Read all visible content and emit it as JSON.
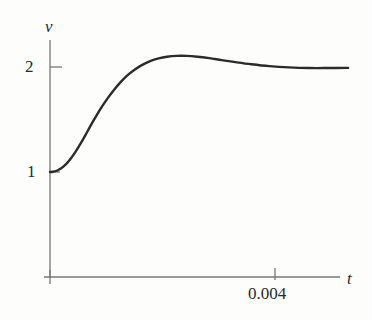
{
  "figure": {
    "name": "step-response-plot",
    "background_color": "#fdfdfc",
    "ink_color": "#2b2b2b",
    "axis_color": "#6e6e6e"
  },
  "axes": {
    "y_axis_label": "v",
    "x_axis_label": "t",
    "y_ticks": [
      {
        "label": "1",
        "value": 1
      },
      {
        "label": "2",
        "value": 2
      }
    ],
    "x_ticks": [
      {
        "label": "0.004",
        "value": 0.004
      }
    ]
  },
  "chart_data": {
    "type": "line",
    "title": "",
    "subtitle": "",
    "xlabel": "t",
    "ylabel": "v",
    "xlim": [
      0,
      0.0053
    ],
    "ylim": [
      0,
      2.62
    ],
    "grid": false,
    "legend": null,
    "annotations": [],
    "x_tick_values": [
      0.004
    ],
    "x_tick_labels": [
      "0.004"
    ],
    "y_tick_values": [
      1,
      2
    ],
    "y_tick_labels": [
      "1",
      "2"
    ],
    "series": [
      {
        "name": "v(t)",
        "color": "#2b2b2b",
        "line_width": 2.4,
        "x": [
          0.0,
          5e-05,
          0.00012,
          0.0002,
          0.00028,
          0.00036,
          0.00045,
          0.00054,
          0.00063,
          0.00072,
          0.00082,
          0.00092,
          0.00103,
          0.00114,
          0.00126,
          0.00138,
          0.00151,
          0.00164,
          0.00178,
          0.00193,
          0.00208,
          0.00225,
          0.00243,
          0.00262,
          0.00283,
          0.00305,
          0.0033,
          0.00358,
          0.0039,
          0.00425,
          0.0046,
          0.00495,
          0.0053
        ],
        "y": [
          1.0,
          1.002,
          1.012,
          1.035,
          1.072,
          1.122,
          1.19,
          1.268,
          1.352,
          1.44,
          1.532,
          1.62,
          1.706,
          1.784,
          1.858,
          1.922,
          1.976,
          2.02,
          2.056,
          2.082,
          2.098,
          2.106,
          2.106,
          2.098,
          2.084,
          2.066,
          2.046,
          2.026,
          2.008,
          1.996,
          1.99,
          1.99,
          1.992
        ]
      }
    ]
  }
}
